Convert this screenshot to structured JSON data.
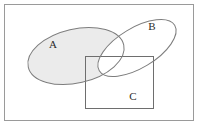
{
  "figure": {
    "kind": "venn-diagram",
    "width": 199,
    "height": 126,
    "background_color": "#ffffff",
    "frame": {
      "name": "universal-set-frame",
      "x": 4,
      "y": 4,
      "width": 190,
      "height": 117,
      "stroke_color": "#9a9a9a",
      "stroke_width": 1,
      "fill": "none"
    }
  },
  "sets": [
    {
      "id": "A",
      "label": "A",
      "shape": "ellipse",
      "cx": 76,
      "cy": 56,
      "rx": 49,
      "ry": 27,
      "rotation_deg": -13,
      "fill_color": "#ebebeb",
      "filled": true,
      "stroke_color": "#7d7d7d",
      "stroke_width": 1,
      "label_x": 53,
      "label_y": 45
    },
    {
      "id": "B",
      "label": "B",
      "shape": "ellipse",
      "cx": 137,
      "cy": 48,
      "rx": 44,
      "ry": 20,
      "rotation_deg": -31,
      "fill_color": "#ffffff",
      "filled": false,
      "stroke_color": "#7d7d7d",
      "stroke_width": 1,
      "label_x": 152,
      "label_y": 27
    },
    {
      "id": "C",
      "label": "C",
      "shape": "rectangle",
      "x": 85,
      "y": 56,
      "width": 69,
      "height": 53,
      "fill_color": "#ffffff",
      "filled": false,
      "stroke_color": "#6e6e6e",
      "stroke_width": 1,
      "label_x": 133,
      "label_y": 97
    }
  ],
  "shading": {
    "description": "Region A minus B is shaded light gray; the A-intersect-B lens is unshaded white.",
    "shaded_region": "A \\ B",
    "shaded_color": "#ebebeb",
    "unshaded_color": "#ffffff"
  },
  "colors": {
    "frame_stroke": "#9a9a9a",
    "set_stroke": "#7d7d7d",
    "rect_stroke": "#6e6e6e",
    "shade_fill": "#ebebeb",
    "label_text": "#2b2b2b",
    "page_background": "#ffffff"
  }
}
